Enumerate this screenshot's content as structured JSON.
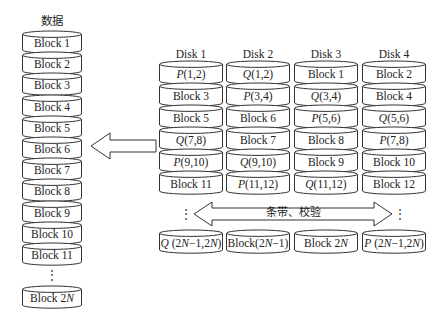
{
  "data_stack": {
    "title": "数据",
    "blocks": [
      "Block 1",
      "Block 2",
      "Block 3",
      "Block 4",
      "Block 5",
      "Block 6",
      "Block 7",
      "Block 8",
      "Block 9",
      "Block 10",
      "Block 11"
    ],
    "ellipsis": "⋮",
    "last_block": "Block 2N"
  },
  "disks": [
    {
      "name": "Disk 1",
      "rows": [
        "P(1,2)",
        "Block 3",
        "Block 5",
        "Q(7,8)",
        "P(9,10)",
        "Block 11"
      ],
      "last": "Q (2N−1,2N)"
    },
    {
      "name": "Disk 2",
      "rows": [
        "Q(1,2)",
        "P(3,4)",
        "Block 6",
        "Block 7",
        "Q(9,10)",
        "P(11,12)"
      ],
      "last": "Block(2N−1)"
    },
    {
      "name": "Disk 3",
      "rows": [
        "Block 1",
        "Q(3,4)",
        "P(5,6)",
        "Block 8",
        "Block 9",
        "Q(11,12)"
      ],
      "last": "Block 2N"
    },
    {
      "name": "Disk 4",
      "rows": [
        "Block 2",
        "Block 4",
        "Q(5,6)",
        "P(7,8)",
        "Block 10",
        "Block 12"
      ],
      "last": "P (2N−1,2N)"
    }
  ],
  "stripe_arrow": {
    "label": "条带、校验"
  },
  "disk_ellipsis": "⋮",
  "colors": {
    "stroke": "#333333",
    "fill": "#ffffff",
    "text": "#222222"
  }
}
